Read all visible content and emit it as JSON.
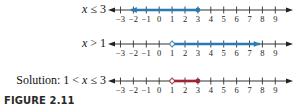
{
  "figure": {
    "caption": "FIGURE 2.11",
    "axis": {
      "ticks": [
        -3,
        -2,
        -1,
        0,
        1,
        2,
        3,
        4,
        5,
        6,
        7,
        8,
        9
      ],
      "tick_labels": [
        "−3",
        "−2",
        "−1",
        "0",
        "1",
        "2",
        "3",
        "4",
        "5",
        "6",
        "7",
        "8",
        "9"
      ],
      "x_start_px": 108,
      "x_end_px": 293,
      "tick0_px": 120.5,
      "px_per_unit": 12.9
    },
    "lines": [
      {
        "label": "x ≤ 3",
        "axis_y": 10,
        "shaded_from": -2.2,
        "shaded_to": 3,
        "left_end": "arrow",
        "right_end": "closed",
        "color": "#2b7bb3"
      },
      {
        "label": "x > 1",
        "axis_y": 44,
        "shaded_from": 1,
        "shaded_to": 7.8,
        "left_end": "open",
        "right_end": "arrow",
        "color": "#2b7bb3"
      },
      {
        "label": "Solution: 1 < x ≤ 3",
        "axis_y": 81,
        "shaded_from": 1,
        "shaded_to": 3,
        "left_end": "open",
        "right_end": "closed",
        "color": "#9e2336"
      }
    ]
  }
}
